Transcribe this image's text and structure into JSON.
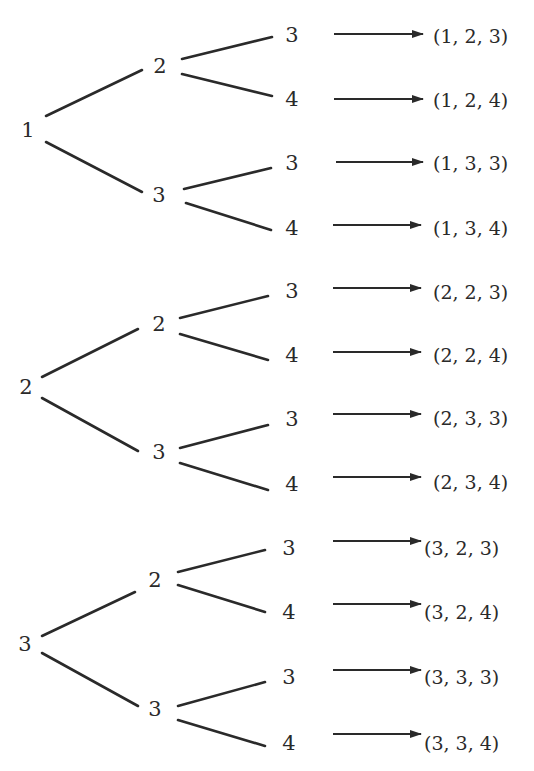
{
  "tree": {
    "branches": [
      {
        "root": "1",
        "mid": [
          {
            "label": "2",
            "leaves": [
              {
                "label": "3",
                "result": "(1, 2, 3)"
              },
              {
                "label": "4",
                "result": "(1, 2, 4)"
              }
            ]
          },
          {
            "label": "3",
            "leaves": [
              {
                "label": "3",
                "result": "(1, 3, 3)"
              },
              {
                "label": "4",
                "result": "(1, 3, 4)"
              }
            ]
          }
        ]
      },
      {
        "root": "2",
        "mid": [
          {
            "label": "2",
            "leaves": [
              {
                "label": "3",
                "result": "(2, 2, 3)"
              },
              {
                "label": "4",
                "result": "(2, 2, 4)"
              }
            ]
          },
          {
            "label": "3",
            "leaves": [
              {
                "label": "3",
                "result": "(2, 3, 3)"
              },
              {
                "label": "4",
                "result": "(2, 3, 4)"
              }
            ]
          }
        ]
      },
      {
        "root": "3",
        "mid": [
          {
            "label": "2",
            "leaves": [
              {
                "label": "3",
                "result": "(3, 2, 3)"
              },
              {
                "label": "4",
                "result": "(3, 2, 4)"
              }
            ]
          },
          {
            "label": "3",
            "leaves": [
              {
                "label": "3",
                "result": "(3, 3, 3)"
              },
              {
                "label": "4",
                "result": "(3, 3, 4)"
              }
            ]
          }
        ]
      }
    ]
  },
  "colors": {
    "ink": "#2a2a2a",
    "background": "#ffffff"
  }
}
